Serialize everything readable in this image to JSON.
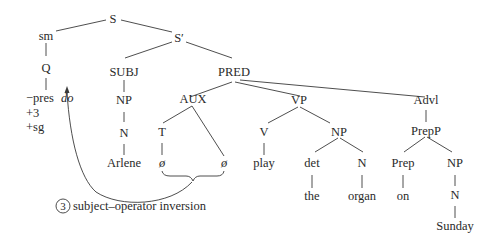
{
  "nodes": {
    "S": "S",
    "S_prime": "S′",
    "sm": "sm",
    "Q": "Q",
    "features": [
      "−pres",
      "+3",
      "+sg"
    ],
    "do": "do",
    "SUBJ": "SUBJ",
    "PRED": "PRED",
    "NP_subj": "NP",
    "N_subj": "N",
    "Arlene": "Arlene",
    "AUX": "AUX",
    "T": "T",
    "null1": "ø",
    "null2": "ø",
    "VP": "VP",
    "V": "V",
    "play": "play",
    "NP_obj": "NP",
    "det": "det",
    "the": "the",
    "N_obj": "N",
    "organ": "organ",
    "Advl": "Advl",
    "PrepP": "PrepP",
    "Prep": "Prep",
    "on": "on",
    "NP_adv": "NP",
    "N_adv": "N",
    "Sunday": "Sunday"
  },
  "annotation": {
    "step_number": "3",
    "label": "subject–operator inversion"
  }
}
